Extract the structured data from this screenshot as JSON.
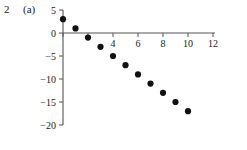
{
  "figure": {
    "number": "2",
    "panel": "(a)"
  },
  "chart_data": {
    "type": "scatter",
    "title": "",
    "subtitle": "",
    "xlabel": "",
    "ylabel": "",
    "x": [
      0,
      1,
      2,
      3,
      4,
      5,
      6,
      7,
      8,
      9,
      10
    ],
    "values": [
      3,
      1,
      -1,
      -3,
      -5,
      -7,
      -9,
      -11,
      -13,
      -15,
      -17
    ],
    "points": [
      {
        "x": 0,
        "y": 3
      },
      {
        "x": 1,
        "y": 1
      },
      {
        "x": 2,
        "y": -1
      },
      {
        "x": 3,
        "y": -3
      },
      {
        "x": 4,
        "y": -5
      },
      {
        "x": 5,
        "y": -7
      },
      {
        "x": 6,
        "y": -9
      },
      {
        "x": 7,
        "y": -11
      },
      {
        "x": 8,
        "y": -13
      },
      {
        "x": 9,
        "y": -15
      },
      {
        "x": 10,
        "y": -17
      }
    ],
    "xlim": [
      0,
      12
    ],
    "ylim": [
      -20,
      5
    ],
    "xticks": [
      0,
      2,
      4,
      6,
      8,
      10,
      12
    ],
    "xtick_labels": [
      "",
      "",
      "4",
      "6",
      "8",
      "10",
      "12"
    ],
    "yticks": [
      5,
      0,
      -5,
      -10,
      -15,
      -20
    ],
    "ytick_labels": [
      "5",
      "0",
      "−5",
      "−10",
      "−15",
      "−20"
    ],
    "grid": false,
    "legend": null,
    "marker": "filled-circle",
    "marker_color": "#111111",
    "axis_color": "#555555",
    "background": "#ffffff"
  }
}
